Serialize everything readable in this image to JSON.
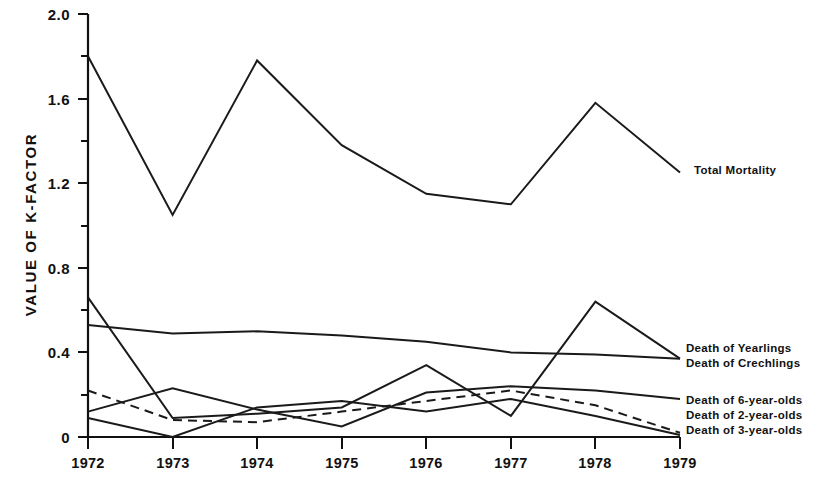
{
  "chart_data": {
    "type": "line",
    "title": "",
    "xlabel": "",
    "ylabel": "VALUE  OF  K-FACTOR",
    "x": [
      1972,
      1973,
      1974,
      1975,
      1976,
      1977,
      1978,
      1979
    ],
    "categories": [
      "1972",
      "1973",
      "1974",
      "1975",
      "1976",
      "1977",
      "1978",
      "1979"
    ],
    "xlim": [
      1972,
      1979
    ],
    "ylim": [
      0,
      2.0
    ],
    "yticks": [
      0,
      0.4,
      0.8,
      1.2,
      1.6,
      2.0
    ],
    "ytick_labels": [
      "0",
      "0.4",
      "0.8",
      "1.2",
      "1.6",
      "2.0"
    ],
    "yticks_minor": [
      0.2,
      0.6,
      1.0,
      1.4,
      1.8
    ],
    "grid": false,
    "legend_position": "right-inline",
    "series": [
      {
        "name": "Total Mortality",
        "style": "solid",
        "values": [
          1.8,
          1.05,
          1.78,
          1.38,
          1.15,
          1.1,
          1.58,
          1.25
        ]
      },
      {
        "name": "Death of Yearlings",
        "style": "solid",
        "values": [
          0.66,
          0.09,
          0.11,
          0.14,
          0.34,
          0.1,
          0.64,
          0.37
        ]
      },
      {
        "name": "Death of Crechlings",
        "style": "solid",
        "values": [
          0.53,
          0.49,
          0.5,
          0.48,
          0.45,
          0.4,
          0.39,
          0.37
        ]
      },
      {
        "name": "Death of 6-year-olds",
        "style": "solid",
        "values": [
          0.12,
          0.23,
          0.13,
          0.05,
          0.21,
          0.24,
          0.22,
          0.18
        ]
      },
      {
        "name": "Death of 2-year-olds",
        "style": "dashed",
        "values": [
          0.22,
          0.08,
          0.07,
          0.12,
          0.17,
          0.22,
          0.15,
          0.02
        ]
      },
      {
        "name": "Death of 3-year-olds",
        "style": "solid",
        "values": [
          0.09,
          0.0,
          0.14,
          0.17,
          0.12,
          0.18,
          0.1,
          0.01
        ]
      }
    ],
    "annotations": [
      {
        "label": "Total Mortality",
        "x": 1979,
        "y": 1.25
      },
      {
        "label": "Death of Yearlings",
        "x": 1979,
        "y": 0.4
      },
      {
        "label": "Death of Crechlings",
        "x": 1979,
        "y": 0.34
      },
      {
        "label": "Death of 6-year-olds",
        "x": 1979,
        "y": 0.18
      },
      {
        "label": "Death of 2-year-olds",
        "x": 1979,
        "y": 0.09
      },
      {
        "label": "Death of 3-year-olds",
        "x": 1979,
        "y": 0.02
      }
    ]
  },
  "axis": {
    "y_label": "VALUE  OF  K-FACTOR",
    "y_tick_0": "0",
    "y_tick_1": "0.4",
    "y_tick_2": "0.8",
    "y_tick_3": "1.2",
    "y_tick_4": "1.6",
    "y_tick_5": "2.0",
    "x_tick_0": "1972",
    "x_tick_1": "1973",
    "x_tick_2": "1974",
    "x_tick_3": "1975",
    "x_tick_4": "1976",
    "x_tick_5": "1977",
    "x_tick_6": "1978",
    "x_tick_7": "1979"
  },
  "legend": {
    "total_mortality": "Total Mortality",
    "yearlings": "Death of Yearlings",
    "crechlings": "Death of Crechlings",
    "six_year_olds": "Death of 6-year-olds",
    "two_year_olds": "Death of 2-year-olds",
    "three_year_olds": "Death of 3-year-olds"
  },
  "colors": {
    "ink": "#1a1a1a",
    "background": "#ffffff"
  }
}
